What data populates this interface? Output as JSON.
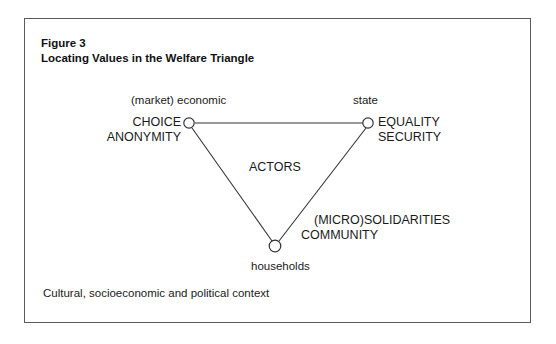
{
  "figure": {
    "number_label": "Figure 3",
    "title": "Locating Values in the Welfare Triangle",
    "context_note": "Cultural, socioeconomic and political context",
    "center_label": "ACTORS"
  },
  "nodes": {
    "market": {
      "sector_label": "(market) economic",
      "values_line1": "CHOICE",
      "values_line2": "ANONYMITY"
    },
    "state": {
      "sector_label": "state",
      "values_line1": "EQUALITY",
      "values_line2": "SECURITY"
    },
    "households": {
      "sector_label": "households",
      "values_line1": "(MICRO)SOLIDARITIES",
      "values_line2": "COMMUNITY"
    }
  },
  "colors": {
    "frame_border": "#5a5a5a",
    "line": "#333333",
    "text": "#1a1a1a",
    "background": "#ffffff"
  }
}
